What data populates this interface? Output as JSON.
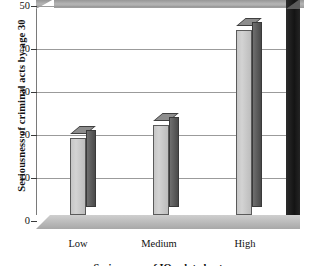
{
  "chart_data": {
    "type": "bar",
    "title": "",
    "xlabel": "Seriousness of IQ-related acts",
    "ylabel": "Seriousness of criminal acts by age 30",
    "categories": [
      "Low",
      "Medium",
      "High"
    ],
    "values": [
      18,
      21,
      43
    ],
    "ylim": [
      0,
      50
    ],
    "yticks": [
      0,
      10,
      20,
      30,
      40,
      50
    ],
    "ytick_labels": [
      "0",
      "10",
      "20",
      "30",
      "40",
      "50"
    ],
    "grid": true,
    "legend": "none",
    "style": "3d-bar",
    "colors": {
      "bar_face": "#c6c6c6",
      "bar_side": "#4a4a4a",
      "bar_top": "#8d8d8d",
      "ceiling": "#a3a3a3",
      "right_wall": "#1a1a1a",
      "floor": "#bdbdbd",
      "gridline": "#9b9b9b",
      "axis": "#3a3a3a",
      "background": "#ffffff",
      "text": "#111111"
    }
  },
  "axis": {
    "y_title": "Seriousness of criminal acts by age 30",
    "x_title": "Seriousness of IQ-related acts",
    "ticks": [
      {
        "label": "50",
        "value": 50
      },
      {
        "label": "40",
        "value": 40
      },
      {
        "label": "30",
        "value": 30
      },
      {
        "label": "20",
        "value": 20
      },
      {
        "label": "10",
        "value": 10
      },
      {
        "label": "0",
        "value": 0
      }
    ]
  },
  "bars": [
    {
      "label": "Low",
      "value": 18
    },
    {
      "label": "Medium",
      "value": 21
    },
    {
      "label": "High",
      "value": 43
    }
  ]
}
